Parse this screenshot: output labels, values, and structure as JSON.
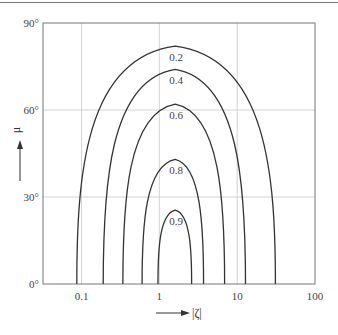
{
  "chart_data": {
    "type": "line",
    "title": "",
    "xlabel": "|ζ|",
    "ylabel": "μ",
    "xscale": "log",
    "xlim": [
      0.032,
      100
    ],
    "ylim": [
      0,
      90
    ],
    "x_ticks": [
      "0.1",
      "1",
      "10",
      "100"
    ],
    "y_ticks": [
      "0°",
      "30°",
      "60°",
      "90°"
    ],
    "grid": true,
    "legend": "none (curves labeled inline)",
    "series": [
      {
        "name": "0.2",
        "label": "0.2",
        "x_left": 0.087,
        "x_right": 31,
        "peak_x": 1.6,
        "peak_y": 82
      },
      {
        "name": "0.4",
        "label": "0.4",
        "x_left": 0.19,
        "x_right": 12.8,
        "peak_x": 1.6,
        "peak_y": 74
      },
      {
        "name": "0.6",
        "label": "0.6",
        "x_left": 0.34,
        "x_right": 6.9,
        "peak_x": 1.6,
        "peak_y": 62
      },
      {
        "name": "0.8",
        "label": "0.8",
        "x_left": 0.6,
        "x_right": 3.7,
        "peak_x": 1.6,
        "peak_y": 43
      },
      {
        "name": "0.9",
        "label": "0.9",
        "x_left": 0.96,
        "x_right": 2.6,
        "peak_x": 1.6,
        "peak_y": 25.5
      }
    ]
  },
  "axes": {
    "x_label": "|ζ|",
    "y_label": "μ",
    "x_ticks": [
      {
        "label": "0.1",
        "value": 0.1
      },
      {
        "label": "1",
        "value": 1
      },
      {
        "label": "10",
        "value": 10
      },
      {
        "label": "100",
        "value": 100
      }
    ],
    "y_ticks": [
      {
        "label": "0°",
        "value": 0
      },
      {
        "label": "30°",
        "value": 30
      },
      {
        "label": "60°",
        "value": 60
      },
      {
        "label": "90°",
        "value": 90
      }
    ]
  },
  "colors": {
    "curve": "#333333",
    "frame": "#777777",
    "grid": "#c8c8c8"
  }
}
